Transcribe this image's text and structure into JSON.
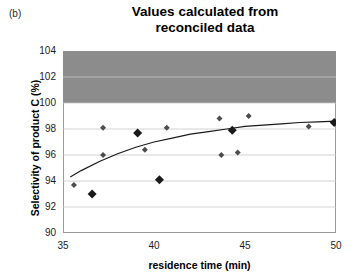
{
  "panel": {
    "label": "(b)"
  },
  "chart_data": {
    "type": "scatter",
    "title": "Values calculated from reconciled data",
    "title_lines": [
      "Values calculated from",
      "reconciled data"
    ],
    "xlabel": "residence time (min)",
    "ylabel": "Selectivity of product C (%)",
    "xlim": [
      35,
      50
    ],
    "ylim": [
      90,
      104
    ],
    "xticks": [
      35,
      40,
      45,
      50
    ],
    "yticks": [
      90,
      92,
      94,
      96,
      98,
      100,
      102,
      104
    ],
    "grid": "horizontal",
    "legend": "none",
    "colors": {
      "marker_dark": "#1a1a1a",
      "marker_gray": "#4d4d4d",
      "band_fill": "#8c8c8c",
      "trend_line": "#1a1a1a",
      "frame": "#9a9a9a",
      "gridline": "#c8c8c8"
    },
    "shaded_band": {
      "label": "infeasible region",
      "y_from": 100,
      "y_to": 104,
      "fill": "#8c8c8c"
    },
    "series": [
      {
        "name": "measured points (small gray markers)",
        "marker": "diamond",
        "marker_size": 6,
        "color": "#4d4d4d",
        "points": [
          [
            35.6,
            93.7
          ],
          [
            37.2,
            98.1
          ],
          [
            37.2,
            96.0
          ],
          [
            39.5,
            96.4
          ],
          [
            40.7,
            98.1
          ],
          [
            43.6,
            98.8
          ],
          [
            43.7,
            96.0
          ],
          [
            44.3,
            97.9
          ],
          [
            44.6,
            96.2
          ],
          [
            45.2,
            99.0
          ],
          [
            48.5,
            98.2
          ]
        ]
      },
      {
        "name": "reconciled points (large black markers)",
        "marker": "diamond",
        "marker_size": 9,
        "color": "#1a1a1a",
        "points": [
          [
            36.6,
            93.0
          ],
          [
            39.1,
            97.7
          ],
          [
            40.3,
            94.1
          ],
          [
            44.3,
            97.9
          ],
          [
            49.9,
            98.5
          ]
        ]
      }
    ],
    "trend_line": {
      "name": "fitted model curve",
      "color": "#1a1a1a",
      "points": [
        [
          35.4,
          94.3
        ],
        [
          36.0,
          94.8
        ],
        [
          37.0,
          95.5
        ],
        [
          38.0,
          96.1
        ],
        [
          39.0,
          96.6
        ],
        [
          40.0,
          97.0
        ],
        [
          41.0,
          97.3
        ],
        [
          42.0,
          97.6
        ],
        [
          43.0,
          97.8
        ],
        [
          44.0,
          98.0
        ],
        [
          45.0,
          98.2
        ],
        [
          46.0,
          98.3
        ],
        [
          47.0,
          98.4
        ],
        [
          48.0,
          98.5
        ],
        [
          49.0,
          98.55
        ],
        [
          50.0,
          98.6
        ]
      ]
    }
  }
}
